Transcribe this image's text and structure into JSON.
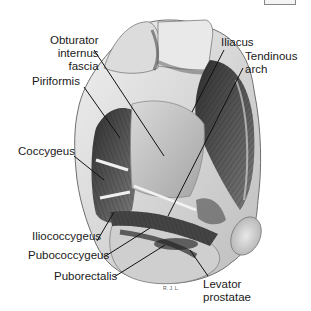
{
  "figure": {
    "signature": "R. J. L.",
    "labels": [
      {
        "id": "obturator",
        "lines": [
          "Obturator",
          "internus",
          "fascia"
        ]
      },
      {
        "id": "piriformis",
        "lines": [
          "Piriformis"
        ]
      },
      {
        "id": "coccygeus",
        "lines": [
          "Coccygeus"
        ]
      },
      {
        "id": "iliacus",
        "lines": [
          "Iliacus"
        ]
      },
      {
        "id": "tendinous",
        "lines": [
          "Tendinous",
          "arch"
        ]
      },
      {
        "id": "iliococcygeus",
        "lines": [
          "Iliococcygeus"
        ]
      },
      {
        "id": "pubococcygeus",
        "lines": [
          "Pubococcygeus"
        ]
      },
      {
        "id": "puborectalis",
        "lines": [
          "Puborectalis"
        ]
      },
      {
        "id": "levator",
        "lines": [
          "Levator",
          "prostatae"
        ]
      }
    ]
  },
  "colors": {
    "background": "#ffffff",
    "text": "#1a1a1a",
    "leader": "#111111",
    "bone_light": "#e6e6e6",
    "bone_mid": "#c8c8c8",
    "muscle_dark": "#3a3a3a",
    "muscle_mid": "#6a6a6a"
  }
}
